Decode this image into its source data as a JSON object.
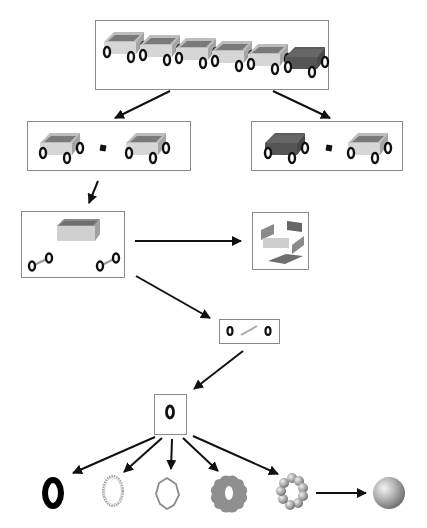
{
  "diagram": {
    "title": "",
    "colors": {
      "border": "#8a8a8a",
      "arrow": "#111111",
      "wagon_light_side": "#d2d2d2",
      "wagon_dark_inner": "#7a7a7a",
      "wagon_dark_body": "#5a5a5a",
      "wheel": "#111111",
      "axle": "#9a9a9a",
      "gear_fill": "#8f8f8f",
      "sphere": "#a8a8a8"
    },
    "nodes": [
      {
        "id": "train",
        "label": "",
        "content": "six wagons in a row (five light, one dark)"
      },
      {
        "id": "pair-light",
        "label": "",
        "content": "two light wagons joined by a connector"
      },
      {
        "id": "pair-dark",
        "label": "",
        "content": "dark wagon and light wagon joined by a connector"
      },
      {
        "id": "wagon-parts",
        "label": "",
        "content": "wagon body and two axles with wheels"
      },
      {
        "id": "body-panels",
        "label": "",
        "content": "exploded panels of wagon body"
      },
      {
        "id": "axle",
        "label": "",
        "content": "axle with two wheels"
      },
      {
        "id": "wheel",
        "label": "",
        "content": "single wheel"
      },
      {
        "id": "wheel-solid",
        "label": "",
        "content": "solid black ring"
      },
      {
        "id": "wheel-outline-dotted",
        "label": "",
        "content": "dotted outline ring"
      },
      {
        "id": "wheel-polygon",
        "label": "",
        "content": "polygonal outline ring"
      },
      {
        "id": "wheel-gear",
        "label": "",
        "content": "gear-shaped filled ring"
      },
      {
        "id": "wheel-spheres",
        "label": "",
        "content": "ring of spheres"
      },
      {
        "id": "sphere",
        "label": "",
        "content": "single sphere"
      }
    ],
    "edges": [
      {
        "from": "train",
        "to": "pair-light"
      },
      {
        "from": "train",
        "to": "pair-dark"
      },
      {
        "from": "pair-light",
        "to": "wagon-parts"
      },
      {
        "from": "wagon-parts",
        "to": "body-panels"
      },
      {
        "from": "wagon-parts",
        "to": "axle"
      },
      {
        "from": "axle",
        "to": "wheel"
      },
      {
        "from": "wheel",
        "to": "wheel-solid"
      },
      {
        "from": "wheel",
        "to": "wheel-outline-dotted"
      },
      {
        "from": "wheel",
        "to": "wheel-polygon"
      },
      {
        "from": "wheel",
        "to": "wheel-gear"
      },
      {
        "from": "wheel",
        "to": "wheel-spheres"
      },
      {
        "from": "wheel-spheres",
        "to": "sphere"
      }
    ]
  }
}
